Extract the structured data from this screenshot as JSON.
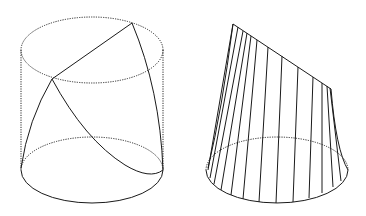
{
  "figures": {
    "left": {
      "name": "cylinder-with-curves",
      "top_ellipse": {
        "cx": 92,
        "cy": 50,
        "rx": 71,
        "ry": 33
      },
      "bottom_ellipse": {
        "cx": 92,
        "cy": 170,
        "rx": 71,
        "ry": 33
      },
      "side_left": {
        "x": 21,
        "y1": 50,
        "y2": 170
      },
      "side_right": {
        "x": 163,
        "y1": 50,
        "y2": 170
      },
      "chord": {
        "x1": 132,
        "y1": 23,
        "x2": 52,
        "y2": 79
      },
      "curves": [
        "M132,23 Q160,90 163,170",
        "M52,79 Q28,120 21,168",
        "M52,79 Q85,140 125,165 Q150,180 163,170"
      ]
    },
    "right": {
      "name": "ruled-surface",
      "bottom_ellipse": {
        "cx": 277,
        "cy": 170,
        "rx": 71,
        "ry": 33
      },
      "top_edge": {
        "x1": 233,
        "y1": 24,
        "x2": 331,
        "y2": 89
      },
      "left_silhouette": "M233,24 Q222,110 208,168",
      "right_silhouette": "M331,89 Q336,150 348,170",
      "rulings": [
        {
          "x1": 233,
          "y1": 24,
          "x2": 208,
          "y2": 170
        },
        {
          "x1": 238,
          "y1": 27,
          "x2": 210,
          "y2": 178
        },
        {
          "x1": 243,
          "y1": 31,
          "x2": 214,
          "y2": 184
        },
        {
          "x1": 247,
          "y1": 33,
          "x2": 221,
          "y2": 190
        },
        {
          "x1": 251,
          "y1": 36,
          "x2": 231,
          "y2": 195
        },
        {
          "x1": 257,
          "y1": 40,
          "x2": 243,
          "y2": 199
        },
        {
          "x1": 268,
          "y1": 47,
          "x2": 259,
          "y2": 202
        },
        {
          "x1": 282,
          "y1": 56,
          "x2": 276,
          "y2": 203
        },
        {
          "x1": 298,
          "y1": 67,
          "x2": 293,
          "y2": 202
        },
        {
          "x1": 313,
          "y1": 77,
          "x2": 309,
          "y2": 198
        },
        {
          "x1": 322,
          "y1": 83,
          "x2": 322,
          "y2": 193
        },
        {
          "x1": 327,
          "y1": 86,
          "x2": 333,
          "y2": 187
        },
        {
          "x1": 330,
          "y1": 88,
          "x2": 341,
          "y2": 181
        }
      ]
    }
  }
}
